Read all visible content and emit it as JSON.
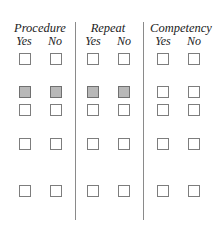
{
  "form": {
    "sections": [
      {
        "title": "Procedure",
        "options": [
          "Yes",
          "No"
        ]
      },
      {
        "title": "Repeat",
        "options": [
          "Yes",
          "No"
        ]
      },
      {
        "title": "Competency",
        "options": [
          "Yes",
          "No"
        ]
      }
    ],
    "rows": [
      {
        "row": 1,
        "shaded": [
          false,
          false,
          false,
          false,
          false,
          false
        ]
      },
      {
        "row": 2,
        "shaded": [
          true,
          true,
          true,
          true,
          false,
          false
        ]
      },
      {
        "row": 3,
        "shaded": [
          false,
          false,
          false,
          false,
          false,
          false
        ]
      },
      {
        "row": 4,
        "shaded": [
          false,
          false,
          false,
          false,
          false,
          false
        ]
      },
      {
        "row": 5,
        "shaded": [
          false,
          false,
          false,
          false,
          false,
          false
        ]
      }
    ],
    "colors": {
      "shaded_fill": "#b8b8b8",
      "border": "#7d7d7d",
      "divider": "#8a8a8a"
    }
  }
}
